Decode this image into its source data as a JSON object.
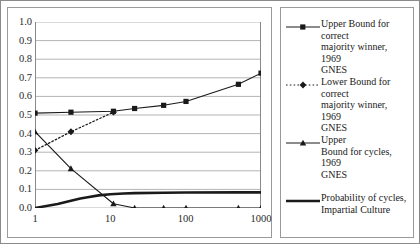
{
  "chart_data": {
    "type": "line",
    "title": "",
    "xlabel": "",
    "ylabel": "",
    "xscale": "log",
    "xlim": [
      1,
      1000
    ],
    "ylim": [
      0,
      1.0
    ],
    "grid": "horizontal",
    "legend_position": "right",
    "xticks": [
      "1",
      "10",
      "100",
      "1000"
    ],
    "xtick_values": [
      1,
      10,
      100,
      1000
    ],
    "yticks": [
      "0.0",
      "0.1",
      "0.2",
      "0.3",
      "0.4",
      "0.5",
      "0.6",
      "0.7",
      "0.8",
      "0.9",
      "1.0"
    ],
    "ytick_values": [
      0.0,
      0.1,
      0.2,
      0.3,
      0.4,
      0.5,
      0.6,
      0.7,
      0.8,
      0.9,
      1.0
    ],
    "series": [
      {
        "name": "Upper Bound for correct majority winner, 1969 GNES",
        "marker": "square",
        "linestyle": "solid",
        "color": "#1a1a1a",
        "x": [
          1,
          3,
          11,
          21,
          51,
          101,
          501,
          1001
        ],
        "values": [
          0.51,
          0.515,
          0.52,
          0.535,
          0.552,
          0.573,
          0.665,
          0.725
        ]
      },
      {
        "name": "Lower Bound for correct majority winner, 1969 GNES",
        "marker": "diamond",
        "linestyle": "dotted",
        "color": "#1a1a1a",
        "x": [
          1,
          3,
          11
        ],
        "values": [
          0.31,
          0.41,
          0.515
        ]
      },
      {
        "name": "Upper Bound for cycles, 1969 GNES",
        "marker": "triangle",
        "linestyle": "solid",
        "color": "#1a1a1a",
        "x": [
          1,
          3,
          11,
          21,
          51,
          101,
          501,
          1001
        ],
        "values": [
          0.41,
          0.212,
          0.023,
          0.0,
          0.0,
          0.0,
          0.0,
          0.0
        ]
      },
      {
        "name": "Probability of cycles, Impartial Culture",
        "marker": "none",
        "linestyle": "thick-solid",
        "color": "#1a1a1a",
        "x": [
          1,
          2,
          3,
          4,
          5,
          7,
          10,
          15,
          21,
          51,
          101,
          501,
          1001
        ],
        "values": [
          0.0,
          0.022,
          0.039,
          0.051,
          0.058,
          0.068,
          0.074,
          0.078,
          0.08,
          0.082,
          0.083,
          0.084,
          0.084
        ]
      }
    ]
  },
  "legend": {
    "entries": [
      {
        "label": "Upper Bound for correct\nmajority winner, 1969\nGNES",
        "marker": "square",
        "linestyle": "solid"
      },
      {
        "label": "Lower Bound for correct\nmajority winner, 1969\nGNES",
        "marker": "diamond",
        "linestyle": "dotted"
      },
      {
        "label": "Upper\nBound for cycles, 1969\nGNES",
        "marker": "triangle",
        "linestyle": "solid"
      },
      {
        "label": "Probability of cycles,\nImpartial Culture",
        "marker": "none",
        "linestyle": "thick-solid"
      }
    ]
  },
  "style": {
    "gridline_color": "#b4b4b4",
    "axis_color": "#8a8a8a",
    "series_color": "#1a1a1a",
    "background": "#ffffff"
  }
}
